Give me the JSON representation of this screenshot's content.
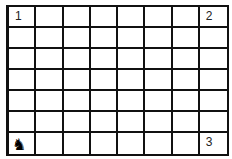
{
  "board": {
    "columns": 8,
    "rows": 7,
    "labels": [
      {
        "row": 0,
        "col": 0,
        "text": "1"
      },
      {
        "row": 0,
        "col": 7,
        "text": "2"
      },
      {
        "row": 6,
        "col": 7,
        "text": "3"
      }
    ],
    "pieces": [
      {
        "row": 6,
        "col": 0,
        "type": "knight",
        "color": "black",
        "glyph": "♞"
      }
    ]
  }
}
